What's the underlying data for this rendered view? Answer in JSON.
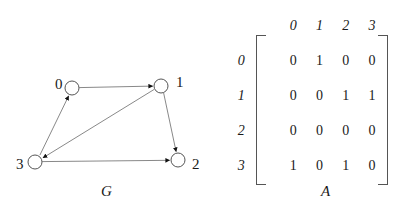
{
  "figure": {
    "graph": {
      "caption": "G",
      "nodes": [
        {
          "id": "0",
          "label": "0",
          "cx": 72,
          "cy": 88,
          "r": 7,
          "label_x": 55,
          "label_y": 77
        },
        {
          "id": "1",
          "label": "1",
          "cx": 161,
          "cy": 86,
          "r": 7,
          "label_x": 176,
          "label_y": 75
        },
        {
          "id": "2",
          "label": "2",
          "cx": 178,
          "cy": 160,
          "r": 7,
          "label_x": 192,
          "label_y": 157
        },
        {
          "id": "3",
          "label": "3",
          "cx": 35,
          "cy": 162,
          "r": 7,
          "label_x": 16,
          "label_y": 157
        }
      ],
      "edges": [
        {
          "from": "0",
          "to": "1"
        },
        {
          "from": "1",
          "to": "2"
        },
        {
          "from": "1",
          "to": "3"
        },
        {
          "from": "3",
          "to": "0"
        },
        {
          "from": "3",
          "to": "2"
        }
      ],
      "edge_color": "#7a7a7a",
      "node_stroke_color": "#555555",
      "arrowhead_color": "#111111"
    },
    "matrix": {
      "caption": "A",
      "column_headers": [
        "0",
        "1",
        "2",
        "3"
      ],
      "row_headers": [
        "0",
        "1",
        "2",
        "3"
      ],
      "rows": [
        [
          "0",
          "1",
          "0",
          "0"
        ],
        [
          "0",
          "0",
          "1",
          "1"
        ],
        [
          "0",
          "0",
          "0",
          "0"
        ],
        [
          "1",
          "0",
          "1",
          "0"
        ]
      ],
      "bracket_color": "#555555"
    }
  }
}
